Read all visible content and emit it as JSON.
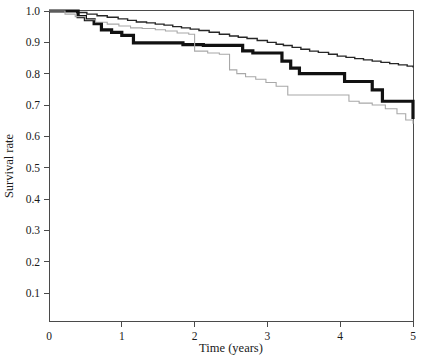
{
  "chart_data": {
    "type": "line",
    "title": "",
    "subtitle": "",
    "xlabel": "Time (years)",
    "ylabel": "Survival rate",
    "xlim": [
      0,
      5
    ],
    "ylim": [
      0,
      1.0
    ],
    "grid": false,
    "legend": "none",
    "xticks": [
      "0",
      "1",
      "2",
      "3",
      "4",
      "5"
    ],
    "xtick_values": [
      0,
      1,
      2,
      3,
      4,
      5
    ],
    "yticks": [
      "0.1",
      "0.2",
      "0.3",
      "0.4",
      "0.5",
      "0.6",
      "0.7",
      "0.8",
      "0.9",
      "1.0"
    ],
    "ytick_values": [
      0.1,
      0.2,
      0.3,
      0.4,
      0.5,
      0.6,
      0.7,
      0.8,
      0.9,
      1.0
    ],
    "step_style": "post",
    "series": [
      {
        "name": "upper-curve",
        "style": "thin-black-step",
        "color": "#262626",
        "linewidth": 1.4,
        "x": [
          0.0,
          0.22,
          0.38,
          0.52,
          0.66,
          0.8,
          0.95,
          1.08,
          1.2,
          1.34,
          1.46,
          1.58,
          1.7,
          1.82,
          1.94,
          2.06,
          2.2,
          2.34,
          2.48,
          2.6,
          2.72,
          2.86,
          3.0,
          3.12,
          3.22,
          3.34,
          3.46,
          3.58,
          3.7,
          3.84,
          3.96,
          4.08,
          4.2,
          4.32,
          4.44,
          4.56,
          4.68,
          4.8,
          4.92,
          5.0
        ],
        "y": [
          1.0,
          1.0,
          0.995,
          0.99,
          0.985,
          0.98,
          0.975,
          0.97,
          0.965,
          0.962,
          0.958,
          0.955,
          0.95,
          0.946,
          0.942,
          0.938,
          0.932,
          0.926,
          0.92,
          0.916,
          0.912,
          0.906,
          0.9,
          0.894,
          0.89,
          0.884,
          0.878,
          0.872,
          0.868,
          0.862,
          0.856,
          0.852,
          0.848,
          0.844,
          0.84,
          0.836,
          0.832,
          0.828,
          0.824,
          0.82
        ]
      },
      {
        "name": "thick-curve",
        "style": "thick-black-step",
        "color": "#111111",
        "linewidth": 3.2,
        "x": [
          0.0,
          0.3,
          0.4,
          0.5,
          0.62,
          0.72,
          0.86,
          1.0,
          1.16,
          1.68,
          1.84,
          2.12,
          2.5,
          2.66,
          2.8,
          3.06,
          3.2,
          3.32,
          3.44,
          3.92,
          4.06,
          4.28,
          4.44,
          4.58,
          4.86,
          5.0
        ],
        "y": [
          1.0,
          1.0,
          0.982,
          0.972,
          0.96,
          0.94,
          0.932,
          0.922,
          0.898,
          0.898,
          0.893,
          0.89,
          0.89,
          0.873,
          0.866,
          0.866,
          0.84,
          0.818,
          0.8,
          0.8,
          0.775,
          0.775,
          0.748,
          0.712,
          0.712,
          0.655
        ]
      },
      {
        "name": "lower-curve",
        "style": "thin-gray-step",
        "color": "#a8a8a8",
        "linewidth": 1.1,
        "x": [
          0.0,
          0.22,
          0.36,
          0.5,
          0.64,
          0.8,
          0.96,
          1.12,
          1.28,
          1.46,
          1.6,
          1.76,
          1.92,
          2.0,
          2.18,
          2.34,
          2.48,
          2.58,
          2.7,
          2.84,
          2.98,
          3.12,
          3.28,
          3.96,
          4.12,
          4.26,
          4.44,
          4.62,
          4.78,
          4.9,
          5.0
        ],
        "y": [
          1.0,
          0.99,
          0.982,
          0.972,
          0.964,
          0.958,
          0.952,
          0.946,
          0.944,
          0.94,
          0.936,
          0.93,
          0.926,
          0.872,
          0.866,
          0.862,
          0.812,
          0.8,
          0.79,
          0.782,
          0.772,
          0.76,
          0.732,
          0.732,
          0.712,
          0.706,
          0.7,
          0.688,
          0.672,
          0.652,
          0.64
        ]
      }
    ]
  },
  "axes": {
    "y_label": "Survival rate",
    "x_label": "Time (years)"
  }
}
